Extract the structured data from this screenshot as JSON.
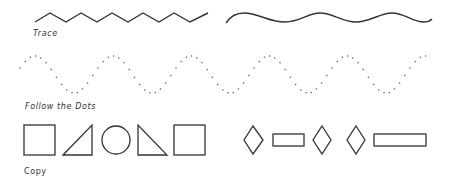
{
  "sections": {
    "trace": {
      "label": "Trace"
    },
    "follow_dots": {
      "label": "Follow the Dots"
    },
    "copy": {
      "label": "Copy"
    }
  },
  "shapes": {
    "trace_lines": [
      "zigzag-line",
      "wavy-line"
    ],
    "dotted_path": "sine-wave-dots",
    "copy_shapes": [
      "square",
      "right-triangle",
      "circle",
      "right-triangle-mirrored",
      "square",
      "diamond",
      "rectangle",
      "diamond",
      "diamond",
      "long-rectangle"
    ]
  },
  "colors": {
    "stroke": "#333333",
    "dots": "#555555",
    "background": "#ffffff"
  }
}
